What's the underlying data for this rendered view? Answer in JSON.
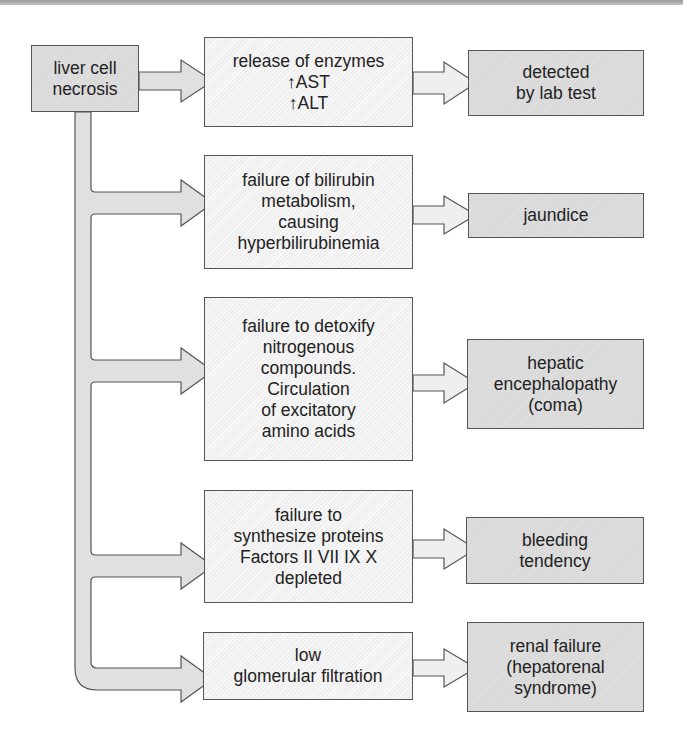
{
  "diagram": {
    "type": "flowchart",
    "colors": {
      "source_box_fill": "#d8d8d8",
      "mechanism_box_fill": "#efefef",
      "outcome_box_fill": "#d9d9d9",
      "arrow_fill": "#e0e0e0",
      "stroke": "#555555"
    },
    "source": {
      "lines": [
        "liver cell",
        "necrosis"
      ]
    },
    "rows": [
      {
        "mechanism": {
          "lines": [
            "release of enzymes",
            "↑AST",
            "↑ALT"
          ]
        },
        "outcome": {
          "lines": [
            "detected",
            "by lab test"
          ]
        }
      },
      {
        "mechanism": {
          "lines": [
            "failure of bilirubin",
            "metabolism,",
            "causing",
            "hyperbilirubinemia"
          ]
        },
        "outcome": {
          "lines": [
            "jaundice"
          ]
        }
      },
      {
        "mechanism": {
          "lines": [
            "failure to detoxify",
            "nitrogenous",
            "compounds.",
            "Circulation",
            "of excitatory",
            "amino acids"
          ]
        },
        "outcome": {
          "lines": [
            "hepatic",
            "encephalopathy",
            "(coma)"
          ]
        }
      },
      {
        "mechanism": {
          "lines": [
            "failure to",
            "synthesize proteins",
            "Factors II VII IX X",
            "depleted"
          ]
        },
        "outcome": {
          "lines": [
            "bleeding",
            "tendency"
          ]
        }
      },
      {
        "mechanism": {
          "lines": [
            "low",
            "glomerular filtration"
          ]
        },
        "outcome": {
          "lines": [
            "renal failure",
            "(hepatorenal",
            "syndrome)"
          ]
        }
      }
    ]
  }
}
